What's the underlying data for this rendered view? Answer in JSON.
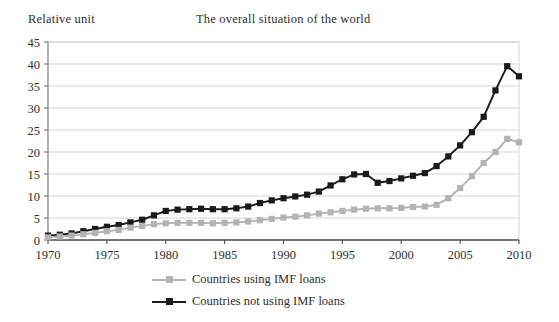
{
  "figure": {
    "title": "The overall situation of the world",
    "y_axis_label": "Relative unit"
  },
  "legend": {
    "items": [
      {
        "label": "Countries using IMF loans",
        "color": "#b3b3b3"
      },
      {
        "label": "Countries not using IMF loans",
        "color": "#1a1a1a"
      }
    ]
  },
  "chart_data": {
    "type": "line",
    "title": "The overall situation of the world",
    "xlabel": "",
    "ylabel": "Relative unit",
    "xlim": [
      1970,
      2010
    ],
    "ylim": [
      0,
      45
    ],
    "xticks": [
      1970,
      1975,
      1980,
      1985,
      1990,
      1995,
      2000,
      2005,
      2010
    ],
    "yticks": [
      0,
      5,
      10,
      15,
      20,
      25,
      30,
      35,
      40,
      45
    ],
    "grid": "horizontal",
    "legend_position": "bottom",
    "markers": "square",
    "x": [
      1970,
      1971,
      1972,
      1973,
      1974,
      1975,
      1976,
      1977,
      1978,
      1979,
      1980,
      1981,
      1982,
      1983,
      1984,
      1985,
      1986,
      1987,
      1988,
      1989,
      1990,
      1991,
      1992,
      1993,
      1994,
      1995,
      1996,
      1997,
      1998,
      1999,
      2000,
      2001,
      2002,
      2003,
      2004,
      2005,
      2006,
      2007,
      2008,
      2009
    ],
    "series": [
      {
        "name": "Countries not using IMF loans",
        "color": "#1a1a1a",
        "values": [
          1.0,
          1.2,
          1.5,
          2.0,
          2.5,
          3.0,
          3.4,
          4.0,
          4.6,
          5.6,
          6.6,
          6.9,
          7.0,
          7.1,
          7.0,
          7.0,
          7.2,
          7.6,
          8.4,
          9.0,
          9.5,
          9.9,
          10.3,
          11.0,
          12.4,
          13.8,
          14.9,
          15.0,
          13.0,
          13.4,
          14.0,
          14.6,
          15.2,
          16.8,
          19.0,
          21.5,
          24.5,
          28.0,
          34.0,
          39.5
        ]
      },
      {
        "name": "Countries using IMF loans",
        "color": "#b3b3b3",
        "values": [
          0.6,
          0.8,
          1.0,
          1.3,
          1.6,
          2.0,
          2.3,
          2.8,
          3.2,
          3.6,
          3.8,
          3.9,
          3.9,
          3.9,
          3.8,
          3.9,
          4.0,
          4.2,
          4.5,
          4.8,
          5.1,
          5.3,
          5.6,
          6.0,
          6.3,
          6.6,
          6.9,
          7.1,
          7.2,
          7.2,
          7.3,
          7.5,
          7.6,
          8.0,
          9.5,
          11.8,
          14.5,
          17.5,
          20.0,
          23.0
        ]
      }
    ],
    "final_points": {
      "x": 2010,
      "values": [
        37.2,
        22.2
      ]
    }
  }
}
